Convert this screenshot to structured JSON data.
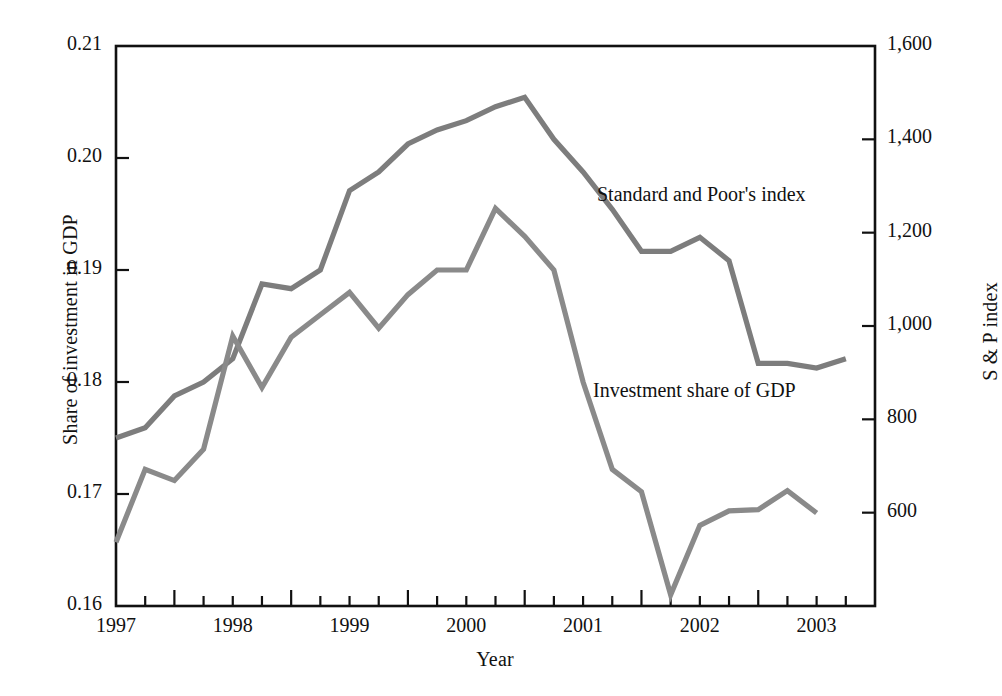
{
  "chart_data": {
    "type": "line",
    "title": "",
    "xlabel": "Year",
    "ylabel": "Share of investment in GDP",
    "ylabel_right": "S & P index",
    "xlim": [
      1996.5,
      2003.0
    ],
    "ylim": [
      0.16,
      0.21
    ],
    "ylim_right": [
      400,
      1600
    ],
    "grid": false,
    "legend_position": "inline-annotations",
    "x_ticks_major": [
      "1997",
      "1998",
      "1999",
      "2000",
      "2001",
      "2002",
      "2003"
    ],
    "x_tick_minor_interval_quarters": 1,
    "y_ticks_left": [
      "0.16",
      "0.17",
      "0.18",
      "0.19",
      "0.20",
      "0.21"
    ],
    "y_ticks_right": [
      "600",
      "800",
      "1,000",
      "1,200",
      "1,400",
      "1,600"
    ],
    "series": [
      {
        "name": "Standard and Poor's index",
        "axis": "right",
        "color": "#7d7d7d",
        "annotation": "Standard and Poor's index",
        "x": [
          1996.5,
          1996.75,
          1997.0,
          1997.25,
          1997.5,
          1997.75,
          1998.0,
          1998.25,
          1998.5,
          1998.75,
          1999.0,
          1999.25,
          1999.5,
          1999.75,
          2000.0,
          2000.25,
          2000.5,
          2000.75,
          2001.0,
          2001.25,
          2001.5,
          2001.75,
          2002.0,
          2002.25,
          2002.5,
          2002.75
        ],
        "values": [
          760,
          782,
          850,
          880,
          930,
          1090,
          1080,
          1120,
          1290,
          1330,
          1390,
          1420,
          1440,
          1470,
          1490,
          1400,
          1330,
          1250,
          1160,
          1160,
          1190,
          1140,
          920,
          920,
          910,
          930
        ]
      },
      {
        "name": "Investment share of GDP",
        "axis": "left",
        "color": "#8a8a8a",
        "annotation": "Investment share of GDP",
        "x": [
          1996.5,
          1996.75,
          1997.0,
          1997.25,
          1997.5,
          1997.75,
          1998.0,
          1998.25,
          1998.5,
          1998.75,
          1999.0,
          1999.25,
          1999.5,
          1999.75,
          2000.0,
          2000.25,
          2000.5,
          2000.75,
          2001.0,
          2001.25,
          2001.5,
          2001.75,
          2002.0,
          2002.25,
          2002.5
        ],
        "values": [
          0.1657,
          0.1722,
          0.1712,
          0.174,
          0.1841,
          0.1795,
          0.184,
          0.186,
          0.188,
          0.1848,
          0.1878,
          0.19,
          0.19,
          0.1955,
          0.193,
          0.19,
          0.18,
          0.1722,
          0.1702,
          0.161,
          0.1672,
          0.1685,
          0.1686,
          0.1703,
          0.1683
        ]
      }
    ]
  },
  "annotations": {
    "sp_label": "Standard and Poor's index",
    "investment_label": "Investment share of GDP"
  },
  "axes": {
    "left_title": "Share of investment in GDP",
    "right_title": "S & P index",
    "x_title": "Year"
  }
}
